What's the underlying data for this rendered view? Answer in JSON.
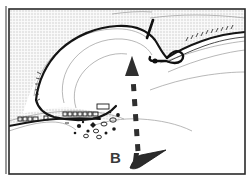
{
  "figure": {
    "kind": "nautical-approach-chart",
    "width": 246,
    "height": 177,
    "background_color": "#ffffff"
  },
  "colors": {
    "land_fill": "#e9e9e9",
    "land_hatch": "#ffffff",
    "water_fill": "#ffffff",
    "coastline_heavy": "#111111",
    "contour_light": "#8d8d8d",
    "structure": "#1a1a1a",
    "vessel": "#2b2b2b",
    "route_arrow": "#2f2f2f",
    "frame_border": "#2a2a2a",
    "label_text": "#3a3a3a"
  },
  "labels": [
    {
      "id": "B",
      "text": "B",
      "x": 110,
      "y": 150
    }
  ],
  "legend_note": "",
  "annotations": {
    "route": {
      "name": "approach-track",
      "style": "dashed",
      "direction": "northward",
      "dash_count": 7,
      "head": "arrowhead-up"
    },
    "vessel": {
      "name": "vessel-B",
      "label": "B",
      "heading": "east",
      "shape": "wedge"
    },
    "breakwater": {
      "name": "breakwater-pier",
      "end_marker": "light-dot"
    }
  },
  "features": [
    {
      "name": "bay-water",
      "type": "water"
    },
    {
      "name": "land-mass",
      "type": "land"
    },
    {
      "name": "shoreline-buildings",
      "type": "structures",
      "count": 12
    },
    {
      "name": "scattered-rocks",
      "type": "rocks",
      "count": 14
    },
    {
      "name": "depth-contours",
      "type": "contours",
      "count": 6
    }
  ]
}
